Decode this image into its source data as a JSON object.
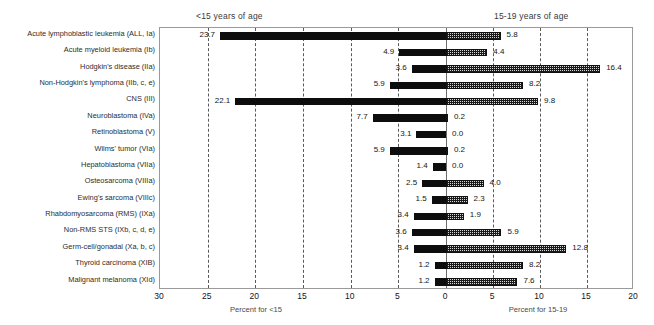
{
  "header": {
    "left_group": "<15 years of age",
    "right_group": "15-19 years of age"
  },
  "axis": {
    "left_label": "Percent for <15",
    "right_label": "Percent for 15-19",
    "left_ticks": [
      "30",
      "25",
      "20",
      "15",
      "10",
      "5"
    ],
    "center_tick": "0",
    "right_ticks": [
      "5",
      "10",
      "15",
      "20"
    ],
    "left_max": 30,
    "right_max": 20
  },
  "chart_data": {
    "type": "bar",
    "orientation": "horizontal-diverging",
    "title": "",
    "xlabel": "Percent",
    "ylabel": "",
    "grid": true,
    "legend_position": "top",
    "axis_left_range": [
      30,
      0
    ],
    "axis_right_range": [
      0,
      20
    ],
    "categories": [
      "Acute lymphoblastic leukemia (ALL, Ia)",
      "Acute myeloid leukemia (Ib)",
      "Hodgkin's disease (IIa)",
      "Non-Hodgkin's lymphoma (IIb, c, e)",
      "CNS (III)",
      "Neuroblastoma (IVa)",
      "Retinoblastoma (V)",
      "Wilms' tumor (VIa)",
      "Hepatoblastoma (VIIa)",
      "Osteosarcoma (VIIIa)",
      "Ewing's sarcoma (VIIIc)",
      "Rhabdomyosarcoma (RMS) (IXa)",
      "Non-RMS STS (IXb, c, d, e)",
      "Germ-cell/gonadal (Xa, b, c)",
      "Thyroid carcinoma (XIB)",
      "Malignant melanoma (XId)"
    ],
    "series": [
      {
        "name": "<15 years of age",
        "values": [
          23.7,
          4.9,
          3.6,
          5.9,
          22.1,
          7.7,
          3.1,
          5.9,
          1.4,
          2.5,
          1.5,
          3.4,
          3.6,
          3.4,
          1.2,
          1.2
        ],
        "labels": [
          "23.7",
          "4.9",
          "3.6",
          "5.9",
          "22.1",
          "7.7",
          "3.1",
          "5.9",
          "1.4",
          "2.5",
          "1.5",
          "3.4",
          "3.6",
          "3.4",
          "1.2",
          "1.2"
        ]
      },
      {
        "name": "15-19 years of age",
        "values": [
          5.8,
          4.4,
          16.4,
          8.2,
          9.8,
          0.2,
          0.0,
          0.2,
          0.0,
          4.0,
          2.3,
          1.9,
          5.9,
          12.8,
          8.2,
          7.6
        ],
        "labels": [
          "5.8",
          "4.4",
          "16.4",
          "8.2",
          "9.8",
          "0.2",
          "0.0",
          "0.2",
          "0.0",
          "4.0",
          "2.3",
          "1.9",
          "5.9",
          "12.8",
          "8.2",
          "7.6"
        ]
      }
    ]
  }
}
